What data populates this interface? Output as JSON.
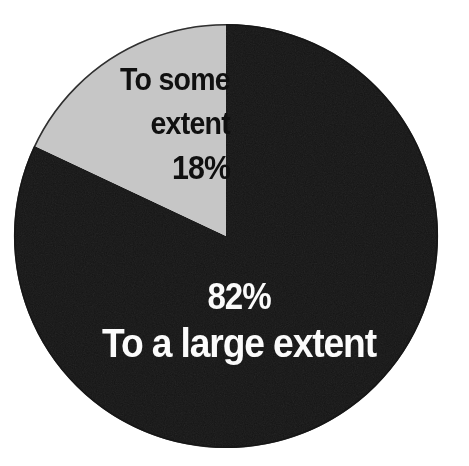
{
  "chart_data": {
    "type": "pie",
    "title": "",
    "subtitle": "",
    "xlabel": "",
    "ylabel": "",
    "legend_position": "none",
    "grid": false,
    "categories": [
      "To a large extent",
      "To some extent"
    ],
    "values": [
      82,
      18
    ],
    "units": "percent",
    "total": 100,
    "start_angle_deg": 0,
    "direction": "clockwise",
    "slices": [
      {
        "label": "To a large extent",
        "value": 82,
        "value_label": "82%",
        "color": "#151515",
        "text_color": "#fbfbfb",
        "start_angle_deg": 0,
        "end_angle_deg": 295.2,
        "label_lines": [
          "82%",
          "To a large extent"
        ]
      },
      {
        "label": "To some extent",
        "value": 18,
        "value_label": "18%",
        "color": "#c6c6c6",
        "text_color": "#101010",
        "start_angle_deg": 295.2,
        "end_angle_deg": 360,
        "label_lines": [
          "To some",
          "extent",
          "18%"
        ]
      }
    ]
  },
  "canvas": {
    "background_color": "#ffffff",
    "width": 469,
    "height": 466
  },
  "pie": {
    "center_x": 226,
    "center_y": 236,
    "radius": 212,
    "outline_color": "#151515"
  },
  "slice_large": {
    "name": "To a large extent",
    "percent_label": "82%",
    "name_label": "To a large extent",
    "fill": "#151515"
  },
  "slice_small": {
    "name": "To some extent",
    "percent_label": "18%",
    "name_line_1": "To some",
    "name_line_2": "extent",
    "fill": "#c6c6c6"
  }
}
